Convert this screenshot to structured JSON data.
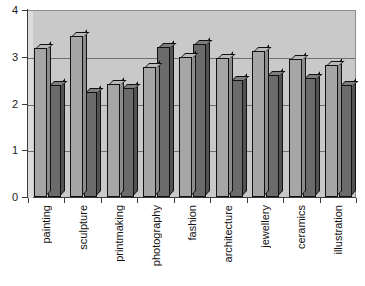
{
  "chart_data": {
    "type": "bar",
    "title": "",
    "subtitle": "",
    "xlabel": "",
    "ylabel": "",
    "ylim": [
      0,
      4
    ],
    "yticks": [
      0,
      1,
      2,
      3,
      4
    ],
    "ytick_labels": [
      "0",
      "1",
      "2",
      "3",
      "4"
    ],
    "grid": true,
    "grid_axis": "y",
    "legend": false,
    "legend_position": "none",
    "categories": [
      "painting",
      "sculpture",
      "printmaking",
      "photography",
      "fashion",
      "architecture",
      "jewellery",
      "ceramics",
      "illustration"
    ],
    "series": [
      {
        "name": "series-1",
        "color": "#a6a6a6",
        "values": [
          3.18,
          3.45,
          2.42,
          2.78,
          3.0,
          2.98,
          3.12,
          2.95,
          2.82
        ]
      },
      {
        "name": "series-2",
        "color": "#6b6b6b",
        "values": [
          2.4,
          2.25,
          2.33,
          3.2,
          3.27,
          2.5,
          2.62,
          2.55,
          2.4
        ]
      }
    ]
  },
  "style": {
    "plot_background": "#c9c9c9",
    "page_background": "#ffffff",
    "axis_color": "#3b3b3b",
    "gridline_color": "#6f6f6f",
    "bar_outline": "#111111"
  }
}
